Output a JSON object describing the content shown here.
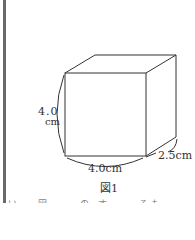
{
  "figure": {
    "shape": "rectangular prism (box) line drawing",
    "height_label_line1": "4.0",
    "height_label_line2": "cm",
    "width_label": "4.0cm",
    "depth_label": "2.5cm",
    "caption": "図1"
  },
  "cutoff_text": "い。 図…… の す…… るもの…… とす……",
  "colors": {
    "line": "#333333",
    "border": "#6a6a6a",
    "background": "#ffffff"
  }
}
